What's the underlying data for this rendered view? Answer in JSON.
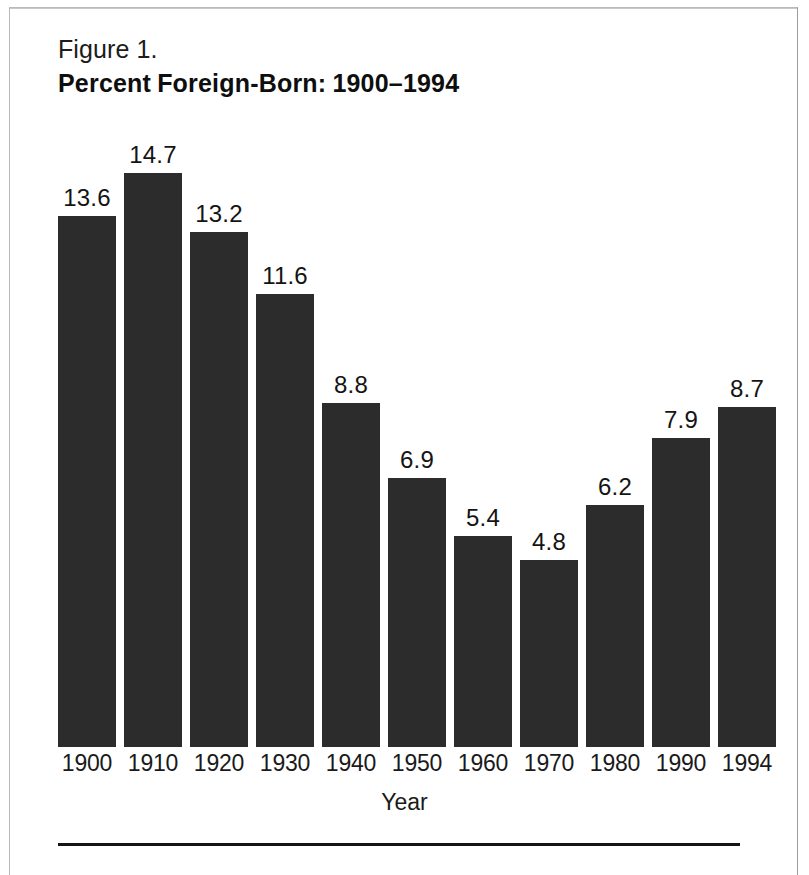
{
  "figure": {
    "number_label": "Figure 1.",
    "title_part_1": "Percent",
    "title_part_2": "Foreign-Born:",
    "title_part_3": "1900–1994",
    "title_full": "Percent  Foreign-Born:  1900–1994"
  },
  "colors": {
    "bar": "#2c2c2c",
    "text": "#141414",
    "frame": "#b9b9b9",
    "rule": "#151515",
    "background": "#ffffff"
  },
  "chart_data": {
    "type": "bar",
    "xlabel": "Year",
    "ylabel": "",
    "categories": [
      "1900",
      "1910",
      "1920",
      "1930",
      "1940",
      "1950",
      "1960",
      "1970",
      "1980",
      "1990",
      "1994"
    ],
    "values": [
      13.6,
      14.7,
      13.2,
      11.6,
      8.8,
      6.9,
      5.4,
      4.8,
      6.2,
      7.9,
      8.7
    ],
    "value_labels": [
      "13.6",
      "14.7",
      "13.2",
      "11.6",
      "8.8",
      "6.9",
      "5.4",
      "4.8",
      "6.2",
      "7.9",
      "8.7"
    ],
    "ylim": [
      0,
      15.8
    ],
    "grid": false,
    "legend": false,
    "axis_visible": false,
    "data_labels": true
  }
}
